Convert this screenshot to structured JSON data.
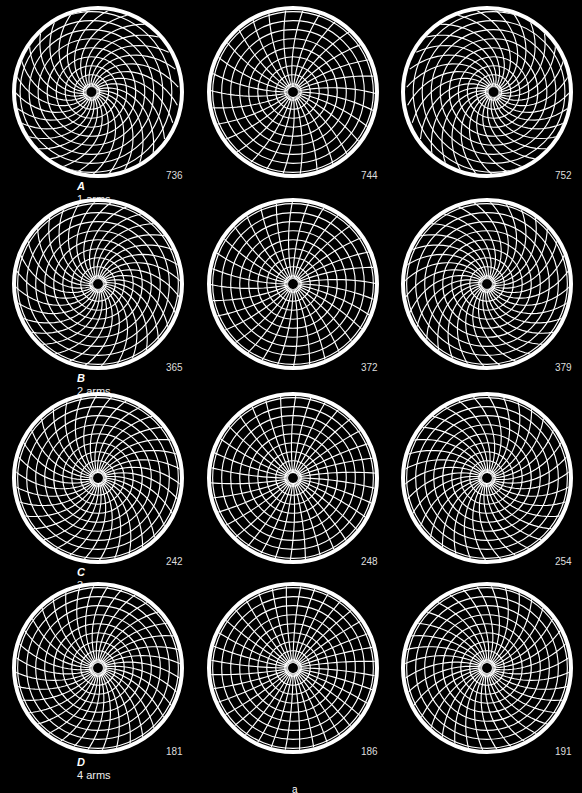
{
  "figure": {
    "background": "#000000",
    "foreground": "#ffffff",
    "rows": [
      {
        "letter": "A",
        "arms_label": "1 arms",
        "arms": 1,
        "counts": [
          "736",
          "744",
          "752"
        ]
      },
      {
        "letter": "B",
        "arms_label": "2 arms",
        "arms": 2,
        "counts": [
          "365",
          "372",
          "379"
        ]
      },
      {
        "letter": "C",
        "arms_label": "3 arms",
        "arms": 3,
        "counts": [
          "242",
          "248",
          "254"
        ]
      },
      {
        "letter": "D",
        "arms_label": "4 arms",
        "arms": 4,
        "counts": [
          "181",
          "186",
          "191"
        ]
      }
    ],
    "footer_mark": "a"
  }
}
